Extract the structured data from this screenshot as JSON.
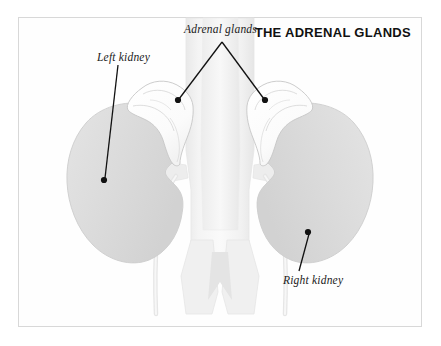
{
  "diagram": {
    "title": "THE ADRENAL GLANDS",
    "background_color": "#ffffff",
    "frame_border_color": "#d8d8d8",
    "labels": [
      {
        "id": "adrenal_glands",
        "text": "Adrenal glands",
        "style": "italic-serif",
        "color": "#1a1a1a",
        "leader_vertex": [
          222,
          42
        ],
        "leader_endpoints": [
          [
            178,
            100
          ],
          [
            265,
            100
          ]
        ]
      },
      {
        "id": "left_kidney",
        "text": "Left kidney",
        "style": "italic-serif",
        "color": "#1a1a1a",
        "leader_endpoints": [
          [
            104,
            180
          ]
        ]
      },
      {
        "id": "right_kidney",
        "text": "Right kidney",
        "style": "italic-serif",
        "color": "#1a1a1a",
        "leader_endpoints": [
          [
            308,
            232
          ]
        ]
      }
    ],
    "structures": {
      "left_kidney_fill": "#dddddd",
      "right_kidney_fill": "#dddddd",
      "kidney_outline": "#cfcfcf",
      "adrenal_gland_fill": "#fdfdfd",
      "adrenal_gland_outline": "#c9c9c9",
      "vessel_fill": "#eeeeee",
      "vessel_outline": "#e2e2e2",
      "leader_line_color": "#111111",
      "leader_dot_color": "#111111"
    }
  }
}
